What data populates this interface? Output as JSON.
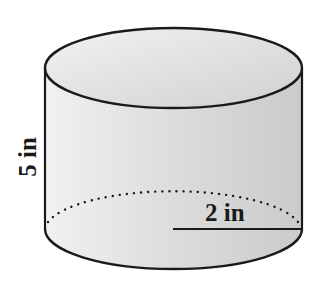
{
  "diagram": {
    "shape": "cylinder",
    "height_label": "5 in",
    "radius_label": "2 in",
    "colors": {
      "stroke": "#1a1a1a",
      "fill_light": "#ececec",
      "fill_dark": "#cfcfcf",
      "background": "#ffffff"
    }
  }
}
